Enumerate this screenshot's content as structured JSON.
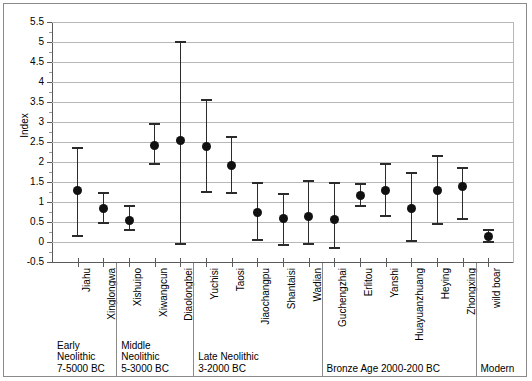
{
  "chart_data": {
    "type": "scatter",
    "title": "",
    "xlabel": "",
    "ylabel": "Index",
    "ylim": [
      -0.5,
      5.5
    ],
    "ytick_step": 0.5,
    "yticks": [
      "5.5",
      "5",
      "4.5",
      "4",
      "3.5",
      "3",
      "2.5",
      "2",
      "1.5",
      "1",
      "0.5",
      "0",
      "-0.5"
    ],
    "grid": "horizontal",
    "legend": "none",
    "marker": "filled-circle",
    "error_bars": "vertical-with-caps",
    "categories": [
      "Jiahu",
      "Xinglongwa",
      "Xishuipo",
      "Xiwangcun",
      "Diaolongbei",
      "Yuchisi",
      "Taosi",
      "Jiaochangpu",
      "Shantaisi",
      "Wadian",
      "Guchengzhai",
      "Erlitou",
      "Yanshi",
      "Huayuanzhuang",
      "Heying",
      "Zhongxing",
      "wild boar"
    ],
    "values": [
      1.28,
      0.85,
      0.53,
      2.42,
      2.55,
      2.38,
      1.92,
      0.75,
      0.6,
      0.65,
      0.57,
      1.17,
      1.28,
      0.83,
      1.28,
      1.38,
      0.15
    ],
    "error_low": [
      0.15,
      0.48,
      0.3,
      1.95,
      -0.05,
      1.25,
      1.22,
      0.05,
      -0.08,
      -0.05,
      -0.15,
      0.9,
      0.65,
      0.02,
      0.45,
      0.58,
      0.0
    ],
    "error_high": [
      2.35,
      1.22,
      0.9,
      2.95,
      5.0,
      3.55,
      2.62,
      1.48,
      1.2,
      1.52,
      1.48,
      1.45,
      1.95,
      1.72,
      2.15,
      1.85,
      0.3
    ],
    "x_group_labels": [
      "Early\nNeolithic\n7-5000 BC",
      "Middle\nNeolithic\n5-3000 BC",
      "Late Neolithic\n3-2000 BC",
      "Bronze Age 2000-200 BC",
      "Modern"
    ],
    "x_group_spans": [
      [
        0,
        1
      ],
      [
        2,
        4
      ],
      [
        5,
        9
      ],
      [
        10,
        15
      ],
      [
        16,
        16
      ]
    ],
    "colors": {
      "marker": "#111111",
      "error_bar": "#2b2b2b",
      "gridline": "#b8b8b8",
      "axis": "#5a5a5a",
      "frame": "#8a8a8a",
      "background": "#ffffff"
    }
  }
}
